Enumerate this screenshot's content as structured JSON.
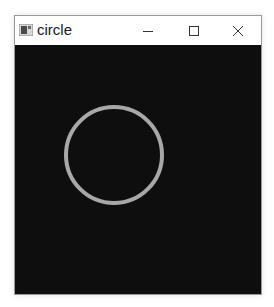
{
  "window": {
    "title": "circle",
    "controls": {
      "minimize": "minimize",
      "maximize": "maximize",
      "close": "close"
    }
  },
  "canvas": {
    "background": "#0e0e0e",
    "shapes": [
      {
        "type": "circle",
        "cx": 99,
        "cy": 110,
        "r": 48,
        "stroke": "#a8a8a8",
        "stroke_width": 4,
        "fill": "none"
      }
    ]
  }
}
